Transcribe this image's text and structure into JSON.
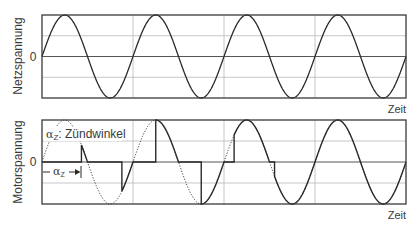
{
  "chart_data": [
    {
      "type": "line",
      "title": "",
      "ylabel": "Netzspannung",
      "xlabel": "Zeit",
      "y_tick_labels": [
        "0"
      ],
      "grid": true,
      "ylim": [
        -1,
        1
      ],
      "x_range_periods": [
        0,
        4.0
      ],
      "series": [
        {
          "name": "Netzspannung",
          "style": "solid",
          "function": "sin",
          "amplitude": 1,
          "periods": 4.0
        }
      ]
    },
    {
      "type": "line",
      "title": "",
      "ylabel": "Motorspannung",
      "xlabel": "Zeit",
      "y_tick_labels": [
        "0"
      ],
      "grid": true,
      "ylim": [
        -1,
        1
      ],
      "x_range_periods": [
        0,
        4.0
      ],
      "annotations": [
        {
          "text": "αZ: Zündwinkel"
        },
        {
          "text": "αZ",
          "type": "arrow",
          "from_half_period_fraction": 0,
          "to_half_period_fraction": 0.87
        }
      ],
      "series": [
        {
          "name": "Netzspannung (Referenz)",
          "style": "dotted",
          "function": "sin",
          "amplitude": 1,
          "periods": 4.0
        },
        {
          "name": "Motorspannung",
          "style": "solid",
          "description": "Phase-angle controlled sine; each half-wave conducts from firing angle to end of half-wave; firing angle decreases until full conduction",
          "firing_angles_deg": [
            156,
            136,
            90,
            90,
            40,
            20,
            0,
            0
          ]
        }
      ]
    }
  ],
  "top_panel": {
    "ylabel": "Netzspannung",
    "zero_label": "0",
    "xlabel": "Zeit"
  },
  "bottom_panel": {
    "ylabel": "Motorspannung",
    "zero_label": "0",
    "xlabel": "Zeit",
    "legend_alpha": "α",
    "legend_sub": "Z",
    "legend_text": ": Zündwinkel",
    "arrow_alpha": "α",
    "arrow_sub": "Z"
  },
  "colors": {
    "curve": "#2a2a2a",
    "frame": "#3a3a3a",
    "grid": "#b8b8b8",
    "text": "#3a3a3a"
  }
}
